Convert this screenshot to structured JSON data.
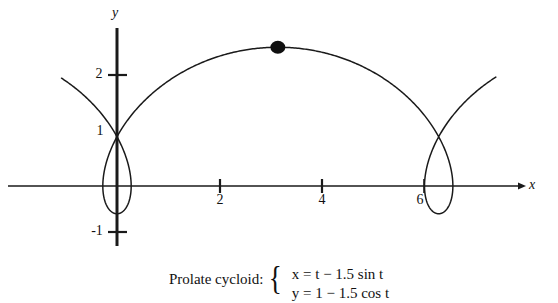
{
  "figure": {
    "kind": "parametric-curve-plot",
    "curve_color": "#1a1a1a",
    "axis_color": "#1a1a1a",
    "background": "#ffffff",
    "point_marker": {
      "label": "",
      "x": 3.14159,
      "y": 2.5
    }
  },
  "axes": {
    "x_label": "x",
    "y_label": "y",
    "x_ticks": [
      {
        "value": 2,
        "label": "2"
      },
      {
        "value": 4,
        "label": "4"
      },
      {
        "value": 6,
        "label": "6"
      }
    ],
    "y_ticks": [
      {
        "value": 2,
        "label": "2"
      },
      {
        "value": 1,
        "label": "1"
      },
      {
        "value": -1,
        "label": "-1"
      }
    ]
  },
  "caption": {
    "title": "Prolate cycloid:",
    "brace": "{",
    "equations": [
      "x = t − 1.5 sin t",
      "y = 1 − 1.5 cos t"
    ]
  },
  "chart_data": {
    "type": "line",
    "title": "Prolate cycloid",
    "xlabel": "x",
    "ylabel": "y",
    "grid": false,
    "legend": "none",
    "xlim": [
      -1.7,
      8.6
    ],
    "ylim": [
      -1.35,
      2.9
    ],
    "parametric": {
      "x_expr": "t - 1.5*sin(t)",
      "y_expr": "1 - 1.5*cos(t)",
      "t_range": [
        -2.25,
        8.55
      ],
      "samples": 900,
      "a": 1,
      "b": 1.5
    },
    "annotations": [
      {
        "type": "point",
        "x": 3.14159,
        "y": 2.5,
        "style": "filled-dot"
      }
    ],
    "xticks": [
      2,
      4,
      6
    ],
    "yticks": [
      -1,
      1,
      2
    ]
  }
}
